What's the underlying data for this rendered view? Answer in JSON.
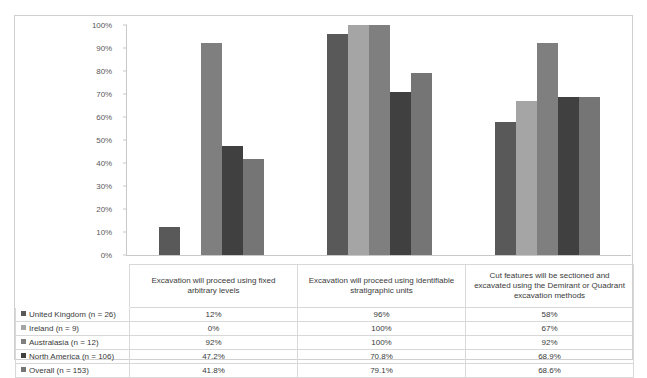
{
  "chart_data": {
    "type": "bar",
    "title": "",
    "subtitle": "",
    "xlabel": "",
    "ylabel": "",
    "ylim": [
      0,
      100
    ],
    "grid": false,
    "legend_position": "table-left",
    "y_ticks": [
      "0%",
      "10%",
      "20%",
      "30%",
      "40%",
      "50%",
      "60%",
      "70%",
      "80%",
      "90%",
      "100%"
    ],
    "y_tick_values": [
      0,
      10,
      20,
      30,
      40,
      50,
      60,
      70,
      80,
      90,
      100
    ],
    "categories": [
      "Excavation will proceed using fixed arbitrary levels",
      "Excavation will proceed using identifiable stratigraphic units",
      "Cut features will be sectioned and excavated using the Demirant or Quadrant excavation methods"
    ],
    "series": [
      {
        "name": "United Kingdom (n = 26)",
        "color": "#595959",
        "values": [
          12,
          96,
          58
        ],
        "labels": [
          "12%",
          "96%",
          "58%"
        ]
      },
      {
        "name": "Ireland (n = 9)",
        "color": "#a5a5a5",
        "values": [
          0,
          100,
          67
        ],
        "labels": [
          "0%",
          "100%",
          "67%"
        ]
      },
      {
        "name": "Australasia (n = 12)",
        "color": "#7f7f7f",
        "values": [
          92,
          100,
          92
        ],
        "labels": [
          "92%",
          "100%",
          "92%"
        ]
      },
      {
        "name": "North America (n = 106)",
        "color": "#404040",
        "values": [
          47.2,
          70.8,
          68.9
        ],
        "labels": [
          "47.2%",
          "70.8%",
          "68.9%"
        ]
      },
      {
        "name": "Overall (n = 153)",
        "color": "#757575",
        "values": [
          41.8,
          79.1,
          68.6
        ],
        "labels": [
          "41.8%",
          "79.1%",
          "68.6%"
        ]
      }
    ]
  }
}
